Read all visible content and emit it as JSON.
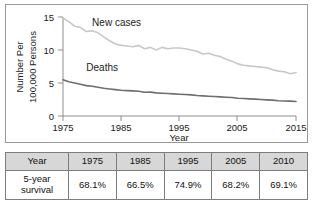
{
  "chart_data": {
    "type": "line",
    "title": "",
    "xlabel": "Year",
    "ylabel": "Number Per 100,000 Persons",
    "ylabel_line1": "Number Per",
    "ylabel_line2": "100,000 Persons",
    "xlim": [
      1975,
      2015
    ],
    "ylim": [
      0,
      15
    ],
    "xticks": [
      1975,
      1985,
      1995,
      2005,
      2015
    ],
    "yticks": [
      0,
      5,
      10,
      15
    ],
    "grid": false,
    "legend_position": "inline-annotations",
    "series": [
      {
        "name": "New cases",
        "color": "#c8c8c8",
        "label_x": 1980,
        "label_y": 13.6,
        "x": [
          1975,
          1976,
          1977,
          1978,
          1979,
          1980,
          1981,
          1982,
          1983,
          1984,
          1985,
          1986,
          1987,
          1988,
          1989,
          1990,
          1991,
          1992,
          1993,
          1994,
          1995,
          1996,
          1997,
          1998,
          1999,
          2000,
          2001,
          2002,
          2003,
          2004,
          2005,
          2006,
          2007,
          2008,
          2009,
          2010,
          2011,
          2012,
          2013,
          2014,
          2015
        ],
        "values": [
          14.8,
          14.3,
          13.6,
          13.4,
          12.8,
          12.9,
          12.6,
          12.0,
          11.4,
          10.9,
          10.7,
          10.6,
          10.5,
          10.7,
          10.2,
          10.4,
          10.0,
          10.4,
          10.2,
          10.3,
          10.3,
          10.2,
          10.0,
          9.8,
          9.4,
          9.5,
          9.2,
          9.0,
          8.6,
          8.3,
          7.9,
          7.7,
          7.6,
          7.5,
          7.4,
          7.3,
          7.0,
          6.8,
          6.7,
          6.4,
          6.6
        ]
      },
      {
        "name": "Deaths",
        "color": "#6e6e6e",
        "label_x": 1979,
        "label_y": 6.9,
        "x": [
          1975,
          1976,
          1977,
          1978,
          1979,
          1980,
          1981,
          1982,
          1983,
          1984,
          1985,
          1986,
          1987,
          1988,
          1989,
          1990,
          1991,
          1992,
          1993,
          1994,
          1995,
          1996,
          1997,
          1998,
          1999,
          2000,
          2001,
          2002,
          2003,
          2004,
          2005,
          2006,
          2007,
          2008,
          2009,
          2010,
          2011,
          2012,
          2013,
          2014,
          2015
        ],
        "values": [
          5.5,
          5.2,
          5.0,
          4.8,
          4.6,
          4.5,
          4.35,
          4.2,
          4.1,
          4.0,
          3.9,
          3.85,
          3.8,
          3.75,
          3.6,
          3.62,
          3.5,
          3.45,
          3.4,
          3.35,
          3.3,
          3.25,
          3.2,
          3.1,
          3.05,
          3.0,
          2.95,
          2.9,
          2.85,
          2.8,
          2.7,
          2.65,
          2.6,
          2.55,
          2.5,
          2.45,
          2.4,
          2.3,
          2.28,
          2.25,
          2.2
        ]
      }
    ]
  },
  "table": {
    "columns": [
      "Year",
      "1975",
      "1985",
      "1995",
      "2005",
      "2010"
    ],
    "rows": [
      {
        "label": "5-year survival",
        "label_line1": "5-year",
        "label_line2": "survival",
        "values": [
          "68.1%",
          "66.5%",
          "74.9%",
          "68.2%",
          "69.1%"
        ]
      }
    ]
  }
}
